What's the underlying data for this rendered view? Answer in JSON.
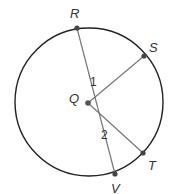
{
  "diagram": {
    "type": "circle-geometry",
    "circle": {
      "center": "Q",
      "cx": 89,
      "cy": 102,
      "r": 74,
      "stroke": "#222222"
    },
    "points": [
      {
        "id": "R",
        "label": "R",
        "x": 77,
        "y": 28,
        "lx": 70,
        "ly": 18
      },
      {
        "id": "S",
        "label": "S",
        "x": 144,
        "y": 56,
        "lx": 149,
        "ly": 52
      },
      {
        "id": "Q",
        "label": "Q",
        "x": 88,
        "y": 103,
        "lx": 69,
        "ly": 103
      },
      {
        "id": "T",
        "label": "T",
        "x": 143,
        "y": 153,
        "lx": 148,
        "ly": 170
      },
      {
        "id": "V",
        "label": "V",
        "x": 115,
        "y": 174,
        "lx": 111,
        "ly": 193
      }
    ],
    "segments": [
      {
        "from": "R",
        "to": "V",
        "note": "diameter through Q"
      },
      {
        "from": "Q",
        "to": "S"
      },
      {
        "from": "Q",
        "to": "T"
      }
    ],
    "angles": [
      {
        "label": "1",
        "x": 90,
        "y": 86
      },
      {
        "label": "2",
        "x": 101,
        "y": 139
      }
    ],
    "line_color": "#777777",
    "point_color": "#444444"
  }
}
